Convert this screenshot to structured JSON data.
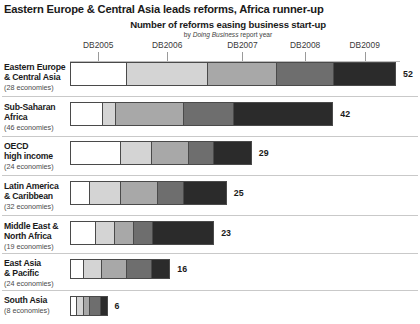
{
  "header": {
    "title": "Eastern Europe & Central Asia leads reforms, Africa runner-up",
    "subtitle": "Number of reforms easing business start-up",
    "source_note_prefix": "by ",
    "source_note_italic": "Doing Business",
    "source_note_suffix": " report year"
  },
  "axis": {
    "tick_labels": [
      "DB2005",
      "DB2006",
      "DB2007",
      "DB2008",
      "DB2009"
    ]
  },
  "economies_suffix": " economies)",
  "chart_data": {
    "type": "bar",
    "orientation": "horizontal",
    "stacked": true,
    "title": "Number of reforms easing business start-up",
    "subtitle": "by Doing Business report year",
    "xlabel": "",
    "ylabel": "",
    "grid": false,
    "legend_position": "top-axis-labels",
    "xlim": [
      0,
      54
    ],
    "series": [
      {
        "name": "DB2005",
        "color": "#ffffff"
      },
      {
        "name": "DB2006",
        "color": "#d4d4d4"
      },
      {
        "name": "DB2007",
        "color": "#a8a8a8"
      },
      {
        "name": "DB2008",
        "color": "#6e6e6e"
      },
      {
        "name": "DB2009",
        "color": "#2b2b2b"
      }
    ],
    "categories": [
      {
        "label_line1": "Eastern Europe",
        "label_line2": "& Central Asia",
        "economies": "(28",
        "total": 52,
        "values": [
          9,
          13,
          11,
          9,
          10
        ]
      },
      {
        "label_line1": "Sub-Saharan",
        "label_line2": "Africa",
        "economies": "(46",
        "total": 42,
        "values": [
          5,
          2,
          11,
          8,
          16
        ]
      },
      {
        "label_line1": "OECD",
        "label_line2": "high income",
        "economies": "(24",
        "total": 29,
        "values": [
          8,
          5,
          6,
          4,
          6
        ]
      },
      {
        "label_line1": "Latin America",
        "label_line2": "& Caribbean",
        "economies": "(32",
        "total": 25,
        "values": [
          3,
          5,
          6,
          4,
          7
        ]
      },
      {
        "label_line1": "Middle East &",
        "label_line2": "North Africa",
        "economies": "(19",
        "total": 23,
        "values": [
          4,
          3,
          3,
          3,
          10
        ]
      },
      {
        "label_line1": "East Asia",
        "label_line2": "& Pacific",
        "economies": "(24",
        "total": 16,
        "values": [
          2,
          3,
          4,
          4,
          3
        ]
      },
      {
        "label_line1": "South Asia",
        "label_line2": "",
        "economies": "(8",
        "total": 6,
        "values": [
          1,
          1,
          1,
          2,
          1
        ]
      }
    ]
  }
}
